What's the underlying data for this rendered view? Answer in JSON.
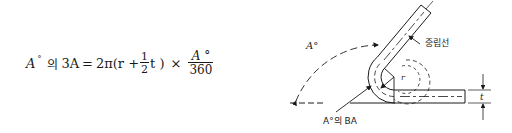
{
  "formula": {
    "lhs_symbol": "A",
    "lhs_degree": "°",
    "lhs_korean": "의",
    "lhs_term": "3A",
    "equals": "=",
    "coefficient": "2π(r +",
    "half_num": "1",
    "half_den": "2",
    "t_close": "t )",
    "times": "×",
    "angle_num": "A °",
    "angle_den": "360"
  },
  "diagram": {
    "angle_label": "A°",
    "neutral_line_label": "중립선",
    "bend_allowance_label": "A°의 BA",
    "radius_label": "r",
    "thickness_label": "t",
    "line_color": "#1a1a1a"
  }
}
